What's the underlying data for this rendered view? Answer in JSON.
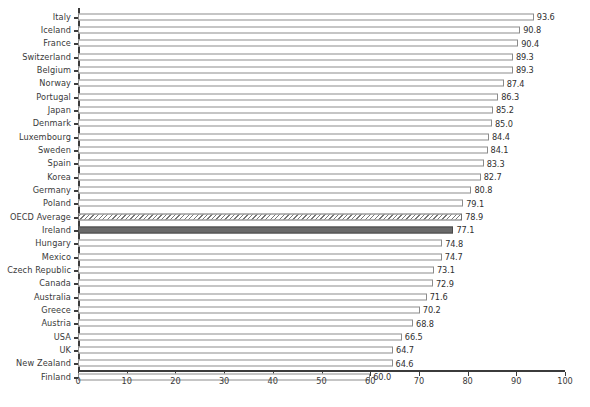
{
  "chart_data": {
    "type": "bar",
    "orientation": "horizontal",
    "title": "",
    "subtitle": "",
    "xlabel": "",
    "ylabel": "",
    "xlim": [
      0,
      100
    ],
    "xticks": [
      0,
      10,
      20,
      30,
      40,
      50,
      60,
      70,
      80,
      90,
      100
    ],
    "grid": false,
    "legend": "none",
    "categories": [
      "Italy",
      "Iceland",
      "France",
      "Switzerland",
      "Belgium",
      "Norway",
      "Portugal",
      "Japan",
      "Denmark",
      "Luxembourg",
      "Sweden",
      "Spain",
      "Korea",
      "Germany",
      "Poland",
      "OECD Average",
      "Ireland",
      "Hungary",
      "Mexico",
      "Czech Republic",
      "Canada",
      "Australia",
      "Greece",
      "Austria",
      "USA",
      "UK",
      "New Zealand",
      "Finland"
    ],
    "values": [
      93.6,
      90.8,
      90.4,
      89.3,
      89.3,
      87.4,
      86.3,
      85.2,
      85.0,
      84.4,
      84.1,
      83.3,
      82.7,
      80.8,
      79.1,
      78.9,
      77.1,
      74.8,
      74.7,
      73.1,
      72.9,
      71.6,
      70.2,
      68.8,
      66.5,
      64.7,
      64.6,
      60.0
    ],
    "value_labels": [
      "93.6",
      "90.8",
      "90.4",
      "89.3",
      "89.3",
      "87.4",
      "86.3",
      "85.2",
      "85.0",
      "84.4",
      "84.1",
      "83.3",
      "82.7",
      "80.8",
      "79.1",
      "78.9",
      "77.1",
      "74.8",
      "74.7",
      "73.1",
      "72.9",
      "71.6",
      "70.2",
      "68.8",
      "66.5",
      "64.7",
      "64.6",
      "60.0"
    ],
    "bar_styles": [
      "plain",
      "plain",
      "plain",
      "plain",
      "plain",
      "plain",
      "plain",
      "plain",
      "plain",
      "plain",
      "plain",
      "plain",
      "plain",
      "plain",
      "plain",
      "hatched",
      "highlight",
      "plain",
      "plain",
      "plain",
      "plain",
      "plain",
      "plain",
      "plain",
      "plain",
      "plain",
      "plain",
      "plain"
    ]
  },
  "colors": {
    "bar_fill": "#ffffff",
    "bar_outline": "#8b8b8b",
    "highlight_fill": "#6a6a6a",
    "hatch_stroke": "#777777",
    "axis": "#3b3b3b",
    "text": "#3a3a3a",
    "background": "#ffffff"
  },
  "caption": {
    "text": ""
  }
}
